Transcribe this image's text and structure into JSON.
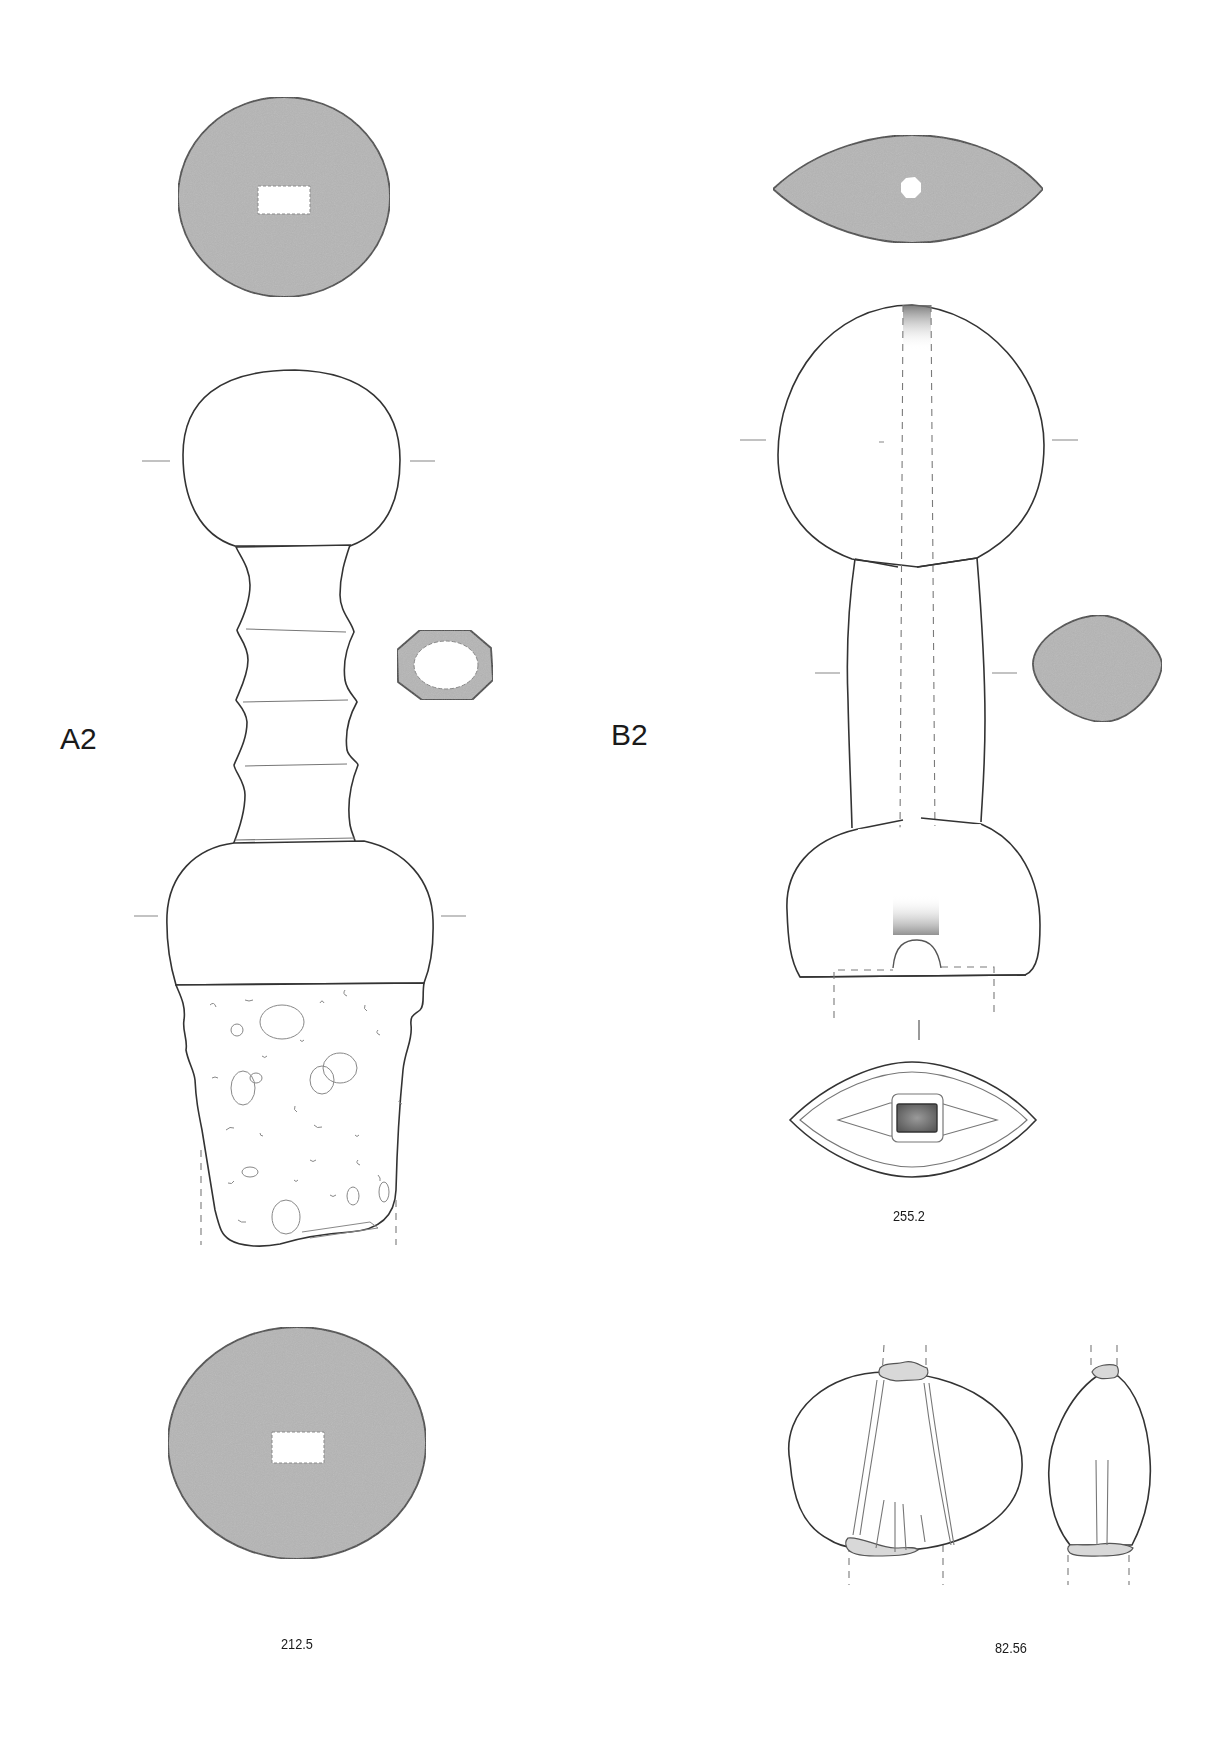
{
  "plate": {
    "background": "#ffffff",
    "section_fill": "#b5b5b5",
    "line_color": "#333333"
  },
  "figures": [
    {
      "id": "A2",
      "label": "A2",
      "catalogue_number": "212.5",
      "views": [
        "pommel-top-section",
        "hilt-elevation",
        "grip-section-octagonal",
        "blade-fragment",
        "guard-bottom-section"
      ]
    },
    {
      "id": "B2",
      "label": "B2",
      "catalogue_number": "255.2",
      "views": [
        "pommel-top-section-lenticular",
        "hilt-elevation",
        "grip-section-lozenge",
        "guard-underside"
      ]
    },
    {
      "id": "82.56",
      "label": "",
      "catalogue_number": "82.56",
      "views": [
        "pommel-front",
        "pommel-side"
      ]
    }
  ],
  "labels": {
    "a2": "A2",
    "b2": "B2",
    "cat_a2": "212.5",
    "cat_b2": "255.2",
    "cat_pommel": "82.56"
  }
}
